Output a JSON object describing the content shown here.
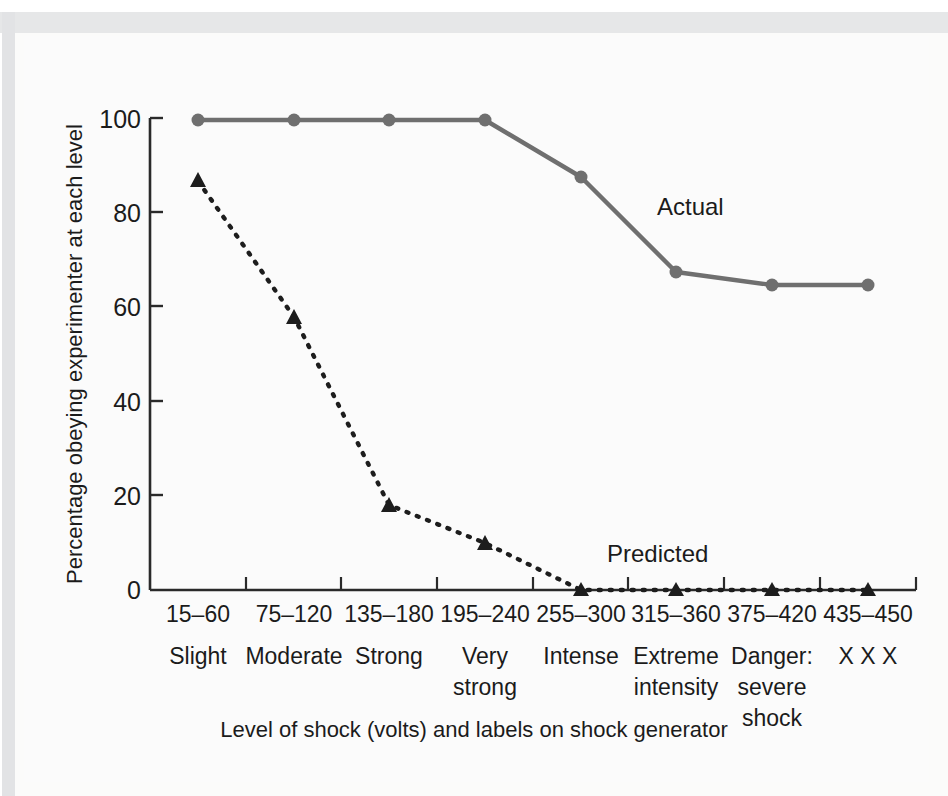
{
  "figure": {
    "background_color": "#fbfbfb",
    "gutter_color": "#e6e7e8"
  },
  "chart_data": {
    "type": "line",
    "title": "",
    "subtitle": "",
    "xlabel": "Level of shock (volts) and labels on shock generator",
    "ylabel": "Percentage obeying experimenter at each level",
    "categories": [
      "15–60",
      "75–120",
      "135–180",
      "195–240",
      "255–300",
      "315–360",
      "375–420",
      "435–450"
    ],
    "category_descriptions": [
      "Slight",
      "Moderate",
      "Strong",
      "Very\nstrong",
      "Intense",
      "Extreme\nintensity",
      "Danger:\nsevere\nshock",
      "X X X"
    ],
    "ylim": [
      0,
      100
    ],
    "yticks": [
      0,
      20,
      40,
      60,
      80,
      100
    ],
    "ytick_labels": [
      "0",
      "20",
      "40",
      "60",
      "80",
      "100"
    ],
    "grid": false,
    "legend_position": "inline-annotation",
    "series": [
      {
        "name": "Actual",
        "style": "solid",
        "marker": "circle",
        "color": "#6f6f6f",
        "values": [
          100,
          100,
          100,
          100,
          87.5,
          67.5,
          65,
          65
        ]
      },
      {
        "name": "Predicted",
        "style": "dotted",
        "marker": "triangle",
        "color": "#1d1d1d",
        "values": [
          87,
          58,
          18,
          10,
          0,
          0,
          0,
          0
        ]
      }
    ],
    "annotations": [
      {
        "text": "Actual",
        "near_category": "315–360",
        "value": 78
      },
      {
        "text": "Predicted",
        "near_category": "315–360",
        "value": 10
      }
    ]
  },
  "axes": {
    "y_title": "Percentage obeying experimenter at each level",
    "x_title": "Level of shock (volts) and labels on shock generator"
  }
}
